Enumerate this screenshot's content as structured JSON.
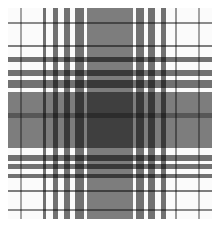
{
  "image": {
    "description": "Grayscale tartan plaid pattern",
    "width": 220,
    "height": 230,
    "pattern_origin": [
      8,
      8
    ],
    "pattern_size": [
      204,
      211
    ],
    "vertical_stripes": [
      {
        "x": 12,
        "w": 2,
        "opacity": 0.35
      },
      {
        "x": 35,
        "w": 3,
        "opacity": 0.55
      },
      {
        "x": 45,
        "w": 5,
        "opacity": 0.55
      },
      {
        "x": 56,
        "w": 6,
        "opacity": 0.55
      },
      {
        "x": 67,
        "w": 9,
        "opacity": 0.55
      },
      {
        "x": 79,
        "w": 46,
        "opacity": 0.5
      },
      {
        "x": 128,
        "w": 8,
        "opacity": 0.55
      },
      {
        "x": 140,
        "w": 7,
        "opacity": 0.55
      },
      {
        "x": 153,
        "w": 5,
        "opacity": 0.55
      },
      {
        "x": 167,
        "w": 2,
        "opacity": 0.4
      },
      {
        "x": 190,
        "w": 2,
        "opacity": 0.35
      }
    ],
    "horizontal_stripes": [
      {
        "y": 14,
        "w": 2,
        "opacity": 0.45
      },
      {
        "y": 37,
        "w": 2,
        "opacity": 0.5
      },
      {
        "y": 49,
        "w": 5,
        "opacity": 0.55
      },
      {
        "y": 62,
        "w": 6,
        "opacity": 0.55
      },
      {
        "y": 72,
        "w": 8,
        "opacity": 0.55
      },
      {
        "y": 84,
        "w": 56,
        "opacity": 0.5
      },
      {
        "y": 105,
        "w": 5,
        "opacity": 0.3
      },
      {
        "y": 147,
        "w": 6,
        "opacity": 0.55
      },
      {
        "y": 156,
        "w": 5,
        "opacity": 0.55
      },
      {
        "y": 166,
        "w": 4,
        "opacity": 0.55
      },
      {
        "y": 182,
        "w": 2,
        "opacity": 0.5
      },
      {
        "y": 201,
        "w": 2,
        "opacity": 0.45
      }
    ]
  }
}
